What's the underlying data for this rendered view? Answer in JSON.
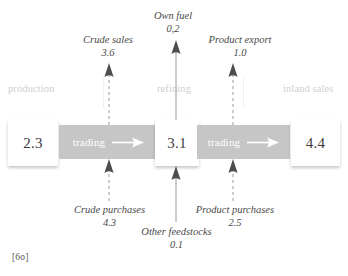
{
  "figure": {
    "caption": "[6o]",
    "sections": [
      {
        "id": "production",
        "label": "production"
      },
      {
        "id": "refining",
        "label": "refining"
      },
      {
        "id": "inland-sales",
        "label": "inland sales"
      }
    ],
    "stocks": [
      {
        "id": "production-volume",
        "value": "2.3"
      },
      {
        "id": "refinery-throughput",
        "value": "3.1"
      },
      {
        "id": "inland-sales-volume",
        "value": "4.4"
      }
    ],
    "processes": [
      {
        "id": "crude-trading",
        "label": "trading"
      },
      {
        "id": "product-trading",
        "label": "trading"
      }
    ],
    "outflows": [
      {
        "id": "crude-sales",
        "name": "Crude sales",
        "value": "3.6"
      },
      {
        "id": "own-fuel",
        "name": "Own fuel",
        "value": "0,2"
      },
      {
        "id": "product-export",
        "name": "Product export",
        "value": "1.0"
      }
    ],
    "inflows": [
      {
        "id": "crude-purchases",
        "name": "Crude purchases",
        "value": "4.3"
      },
      {
        "id": "other-feedstocks",
        "name": "Other feedstocks",
        "value": "0.1"
      },
      {
        "id": "product-purchases",
        "name": "Product purchases",
        "value": "2.5"
      }
    ],
    "colors": {
      "trading_bar": "#c6c6c6",
      "section_label": "#cfcfcf",
      "value_text": "#3b3b3b",
      "flow_label": "#4a4a4a",
      "arrow": "#8a8a8a",
      "background": "#ffffff"
    }
  }
}
